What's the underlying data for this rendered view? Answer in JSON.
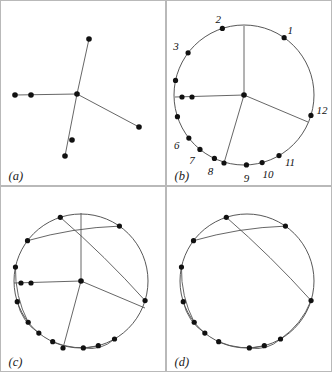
{
  "figure": {
    "kind": "four-panel-geometric-diagram",
    "background": "#ffffff",
    "border_color": "#b9b9b9",
    "ink_color": "#111111",
    "edge_color": "#555555",
    "panels": [
      {
        "id": "a",
        "label": "(a)",
        "caption_label": "(a)",
        "has_circle": false,
        "has_hub": true,
        "has_chords": false
      },
      {
        "id": "b",
        "label": "(b)",
        "caption_label": "(b)",
        "has_circle": true,
        "has_hub": true,
        "has_chords": false
      },
      {
        "id": "c",
        "label": "(c)",
        "caption_label": "(c)",
        "has_circle": true,
        "has_hub": true,
        "has_chords": true
      },
      {
        "id": "d",
        "label": "(d)",
        "caption_label": "(d)",
        "has_circle": true,
        "has_hub": false,
        "has_chords": true
      }
    ],
    "vertex_labels": [
      "1",
      "2",
      "3",
      "4",
      "5",
      "6",
      "7",
      "8",
      "9",
      "10",
      "11",
      "12"
    ]
  },
  "chart_data": {
    "type": "scatter",
    "title": "",
    "xlabel": "",
    "ylabel": "",
    "grid": false,
    "legend": "none",
    "panel_a": {
      "label": "(a)",
      "center": [
        76,
        93
      ],
      "nodes": [
        [
          76,
          93
        ],
        [
          88,
          38
        ],
        [
          14,
          94
        ],
        [
          30,
          94
        ],
        [
          138,
          126
        ],
        [
          71,
          139
        ],
        [
          64,
          155
        ]
      ],
      "edges": [
        [
          [
            76,
            93
          ],
          [
            88,
            38
          ]
        ],
        [
          [
            76,
            93
          ],
          [
            14,
            94
          ]
        ],
        [
          [
            76,
            93
          ],
          [
            138,
            126
          ]
        ],
        [
          [
            76,
            93
          ],
          [
            64,
            155
          ]
        ]
      ]
    },
    "panel_b": {
      "label": "(b)",
      "circle_center": [
        243,
        94
      ],
      "circle_radius": 70,
      "center": [
        243,
        94
      ],
      "ring_nodes": [
        {
          "n": "1",
          "angle": 55,
          "label_dx": 6,
          "label_dy": -6
        },
        {
          "n": "2",
          "angle": 108,
          "label_dx": -4,
          "label_dy": -8
        },
        {
          "n": "3",
          "angle": 143,
          "label_dx": -12,
          "label_dy": -5
        },
        {
          "n": "4",
          "angle": 168,
          "label_dx": -14,
          "label_dy": 0
        },
        {
          "n": "5",
          "angle": 198,
          "label_dx": -14,
          "label_dy": 4
        },
        {
          "n": "6",
          "angle": 218,
          "label_dx": -12,
          "label_dy": 8
        },
        {
          "n": "7",
          "angle": 231,
          "label_dx": -8,
          "label_dy": 12
        },
        {
          "n": "8",
          "angle": 245,
          "label_dx": -4,
          "label_dy": 14
        },
        {
          "n": "9",
          "angle": 272,
          "label_dx": 0,
          "label_dy": 15
        },
        {
          "n": "10",
          "angle": 285,
          "label_dx": 6,
          "label_dy": 13
        },
        {
          "n": "11",
          "angle": 300,
          "label_dx": 11,
          "label_dy": 8
        },
        {
          "n": "12",
          "angle": 343,
          "label_dx": 11,
          "label_dy": -4
        }
      ],
      "spokes": [
        [
          [
            243,
            94
          ],
          [
            243,
            25
          ]
        ],
        [
          [
            243,
            94
          ],
          [
            174,
            96
          ]
        ],
        [
          [
            243,
            94
          ],
          [
            307,
            121
          ]
        ],
        [
          [
            243,
            94
          ],
          [
            223,
            162
          ]
        ]
      ],
      "extra_nodes": [
        [
          181,
          96
        ],
        [
          191,
          96
        ],
        [
          223,
          162
        ]
      ]
    },
    "panel_c": {
      "label": "(c)",
      "circle_center": [
        80,
        280
      ],
      "circle_radius": 67,
      "center": [
        80,
        280
      ],
      "ring_angles": [
        55,
        108,
        143,
        168,
        198,
        218,
        231,
        245,
        272,
        285,
        300,
        343
      ],
      "spokes": [
        [
          [
            80,
            280
          ],
          [
            80,
            212
          ]
        ],
        [
          [
            80,
            280
          ],
          [
            13,
            282
          ]
        ],
        [
          [
            80,
            280
          ],
          [
            144,
            307
          ]
        ],
        [
          [
            80,
            280
          ],
          [
            62,
            347
          ]
        ]
      ],
      "extra_nodes": [
        [
          20,
          282
        ],
        [
          30,
          282
        ],
        [
          62,
          347
        ]
      ],
      "chords": [
        [
          143,
          55
        ],
        [
          168,
          218
        ],
        [
          198,
          231
        ],
        [
          245,
          285
        ],
        [
          272,
          300
        ],
        [
          108,
          343
        ]
      ]
    },
    "panel_d": {
      "label": "(d)",
      "circle_center": [
        246,
        280
      ],
      "circle_radius": 67,
      "ring_angles": [
        55,
        108,
        143,
        168,
        198,
        218,
        231,
        245,
        272,
        285,
        300,
        343
      ],
      "chords": [
        [
          143,
          55
        ],
        [
          168,
          218
        ],
        [
          198,
          231
        ],
        [
          245,
          285
        ],
        [
          272,
          300
        ],
        [
          108,
          343
        ],
        [
          343,
          300
        ]
      ]
    }
  }
}
